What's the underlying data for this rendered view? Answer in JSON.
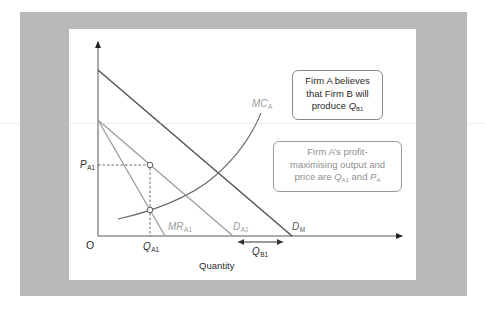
{
  "colors": {
    "outer_panel": "#b9b9b9",
    "inner_panel": "#ffffff",
    "dark_line": "#4a4a4a",
    "light_line": "#9c9c9c",
    "annotation_border": "#8a8a8a"
  },
  "axes": {
    "origin_label": "O",
    "x_label": "Quantity",
    "y_label": ""
  },
  "labels": {
    "p_a1": {
      "main": "P",
      "sub": "A1"
    },
    "q_a1": {
      "main": "Q",
      "sub": "A1"
    },
    "q_b1": {
      "main": "Q",
      "sub": "B1"
    },
    "mc_a": {
      "main": "MC",
      "sub": "A"
    },
    "mr_a1": {
      "main": "MR",
      "sub": "A1"
    },
    "d_a1": {
      "main": "D",
      "sub": "A1"
    },
    "d_m": {
      "main": "D",
      "sub": "M"
    }
  },
  "annotations": {
    "belief": {
      "line1": "Firm A believes",
      "line2": "that Firm B will",
      "line3_prefix": "produce ",
      "line3_var": "Q",
      "line3_sub": "B1"
    },
    "optimum": {
      "line1": "Firm A’s profit-",
      "line2": "maximising output and",
      "line3_prefix": "price are ",
      "line3_var1": "Q",
      "line3_sub1": "A1",
      "line3_mid": " and ",
      "line3_var2": "P",
      "line3_sub2": "A"
    }
  },
  "curves": [
    {
      "name": "D_M",
      "type": "line",
      "from": [
        98,
        70
      ],
      "to": [
        292,
        236
      ],
      "color": "dark"
    },
    {
      "name": "D_A1",
      "type": "line",
      "from": [
        98,
        120
      ],
      "to": [
        233,
        236
      ],
      "color": "light"
    },
    {
      "name": "MR_A1",
      "type": "line",
      "from": [
        98,
        120
      ],
      "to": [
        165,
        236
      ],
      "color": "light"
    },
    {
      "name": "MC_A",
      "type": "curve",
      "color": "dark"
    }
  ],
  "points": [
    {
      "name": "demand-point",
      "x": 150,
      "y": 165
    },
    {
      "name": "mc-mr-intersection",
      "x": 150,
      "y": 210
    }
  ]
}
